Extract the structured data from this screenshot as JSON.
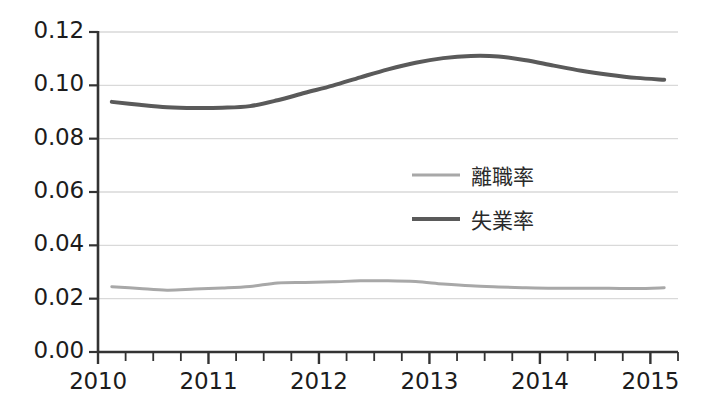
{
  "chart_data": {
    "type": "line",
    "title": "",
    "subtitle": "",
    "xlabel": "",
    "ylabel": "",
    "xlim": [
      2010.0,
      2015.25
    ],
    "ylim": [
      0.0,
      0.12
    ],
    "grid": true,
    "grid_axis": "y",
    "legend_position": "center-right",
    "y_ticks": [
      "0.00",
      "0.02",
      "0.04",
      "0.06",
      "0.08",
      "0.10",
      "0.12"
    ],
    "y_tick_values": [
      0.0,
      0.02,
      0.04,
      0.06,
      0.08,
      0.1,
      0.12
    ],
    "x_ticks": [
      "2010",
      "2011",
      "2012",
      "2013",
      "2014",
      "2015"
    ],
    "x_tick_values": [
      2010,
      2011,
      2012,
      2013,
      2014,
      2015
    ],
    "x_minor_tick_interval": 0.25,
    "x": [
      2010.125,
      2010.375,
      2010.625,
      2010.875,
      2011.125,
      2011.375,
      2011.625,
      2011.875,
      2012.125,
      2012.375,
      2012.625,
      2012.875,
      2013.125,
      2013.375,
      2013.625,
      2013.875,
      2014.125,
      2014.375,
      2014.625,
      2014.875,
      2015.125
    ],
    "series": [
      {
        "name": "離職率",
        "color": "#a8a8a8",
        "line_width": 3,
        "values": [
          0.0245,
          0.0238,
          0.0232,
          0.0236,
          0.024,
          0.0246,
          0.0259,
          0.0261,
          0.0263,
          0.0267,
          0.0267,
          0.0264,
          0.0255,
          0.0248,
          0.0244,
          0.0241,
          0.0239,
          0.0239,
          0.0239,
          0.0238,
          0.0241
        ]
      },
      {
        "name": "失業率",
        "color": "#5a5a5a",
        "line_width": 4,
        "values": [
          0.0938,
          0.0927,
          0.0918,
          0.0915,
          0.0916,
          0.0922,
          0.0944,
          0.0972,
          0.0999,
          0.103,
          0.106,
          0.1085,
          0.1102,
          0.111,
          0.1108,
          0.1094,
          0.1074,
          0.1055,
          0.104,
          0.1028,
          0.1021
        ]
      }
    ]
  },
  "axes": {
    "axis_color": "#333333",
    "grid_color": "#d9d9d9",
    "tick_label_color": "#1c1c1c"
  },
  "legend": {
    "items": [
      {
        "label": "離職率",
        "color": "#a8a8a8"
      },
      {
        "label": "失業率",
        "color": "#5a5a5a"
      }
    ]
  }
}
